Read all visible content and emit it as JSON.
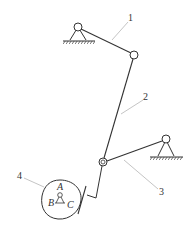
{
  "diagram": {
    "type": "linkage-cam mechanism",
    "labels": {
      "link1": "1",
      "link2": "2",
      "link3": "3",
      "cam": "4",
      "pointA": "A",
      "pointB": "B",
      "pointC": "C"
    },
    "colors": {
      "line": "#333333",
      "leader": "#aaaaaa",
      "background": "#ffffff"
    }
  }
}
